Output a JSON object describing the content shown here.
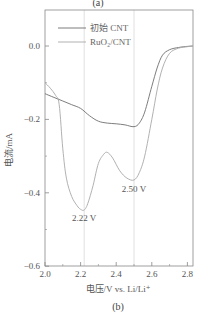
{
  "figure": {
    "top_caption": "(a)",
    "bottom_caption": "(b)"
  },
  "colors": {
    "frame": "#888888",
    "guide": "#d8d8d8",
    "series_initial": "#6e6e6e",
    "series_ruo2": "#a8a8a8"
  },
  "chart_data": {
    "type": "line",
    "title": "",
    "xlabel": "电压/V vs. Li/Li⁺",
    "ylabel": "电流/mA",
    "xlim": [
      2.0,
      2.83
    ],
    "ylim": [
      -0.6,
      0.1
    ],
    "xticks": [
      2.0,
      2.2,
      2.4,
      2.6,
      2.8
    ],
    "xtick_labels": [
      "2.0",
      "2.2",
      "2.4",
      "2.6",
      "2.8"
    ],
    "yticks": [
      0.0,
      -0.2,
      -0.4,
      -0.6
    ],
    "ytick_labels": [
      "0.0",
      "−0.2",
      "−0.4",
      "−0.6"
    ],
    "grid": false,
    "legend_position": "upper left",
    "guide_lines_x": [
      2.22,
      2.5
    ],
    "annotations": [
      {
        "text": "2.22 V",
        "x": 2.22,
        "y": -0.47
      },
      {
        "text": "2.50 V",
        "x": 2.5,
        "y": -0.39
      }
    ],
    "series": [
      {
        "name": "初始 CNT",
        "x": [
          2.0,
          2.05,
          2.1,
          2.15,
          2.2,
          2.25,
          2.3,
          2.35,
          2.4,
          2.45,
          2.5,
          2.53,
          2.56,
          2.6,
          2.63,
          2.66,
          2.7,
          2.75,
          2.8,
          2.83
        ],
        "y": [
          -0.13,
          -0.14,
          -0.15,
          -0.16,
          -0.17,
          -0.19,
          -0.205,
          -0.21,
          -0.212,
          -0.215,
          -0.22,
          -0.21,
          -0.18,
          -0.11,
          -0.06,
          -0.025,
          -0.01,
          -0.004,
          -0.001,
          0.0
        ]
      },
      {
        "name": "RuO₂/CNT",
        "x": [
          2.0,
          2.03,
          2.06,
          2.08,
          2.1,
          2.12,
          2.15,
          2.18,
          2.2,
          2.22,
          2.24,
          2.27,
          2.3,
          2.33,
          2.35,
          2.38,
          2.42,
          2.46,
          2.5,
          2.53,
          2.56,
          2.6,
          2.63,
          2.66,
          2.7,
          2.75,
          2.8,
          2.83
        ],
        "y": [
          -0.1,
          -0.115,
          -0.135,
          -0.16,
          -0.28,
          -0.36,
          -0.41,
          -0.435,
          -0.445,
          -0.447,
          -0.43,
          -0.38,
          -0.32,
          -0.295,
          -0.29,
          -0.305,
          -0.34,
          -0.36,
          -0.365,
          -0.345,
          -0.3,
          -0.2,
          -0.12,
          -0.06,
          -0.02,
          -0.006,
          -0.002,
          0.0
        ]
      }
    ]
  }
}
